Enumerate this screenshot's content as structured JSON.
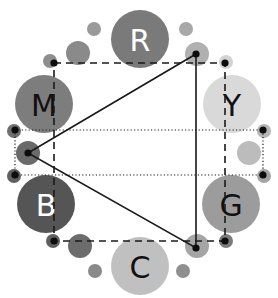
{
  "diagram": {
    "type": "color-wheel",
    "colors": {
      "background": "#ffffff",
      "line": "#1a1a1a"
    },
    "nodes": [
      {
        "id": "R",
        "label": "R",
        "cx": 140,
        "cy": 39,
        "r": 29,
        "fill": "#7a7a7a",
        "text_color": "#ffffff"
      },
      {
        "id": "M",
        "label": "M",
        "cx": 44,
        "cy": 104,
        "r": 29,
        "fill": "#7d7d7d",
        "text_color": "#111111"
      },
      {
        "id": "Y",
        "label": "Y",
        "cx": 232,
        "cy": 104,
        "r": 29,
        "fill": "#d9d9d9",
        "text_color": "#111111"
      },
      {
        "id": "B",
        "label": "B",
        "cx": 46,
        "cy": 204,
        "r": 29,
        "fill": "#555555",
        "text_color": "#ffffff"
      },
      {
        "id": "G",
        "label": "G",
        "cx": 231,
        "cy": 204,
        "r": 29,
        "fill": "#9c9c9c",
        "text_color": "#111111"
      },
      {
        "id": "C",
        "label": "C",
        "cx": 140,
        "cy": 266,
        "r": 29,
        "fill": "#c0c0c0",
        "text_color": "#111111"
      }
    ],
    "small_circles": [
      {
        "cx": 94,
        "cy": 29,
        "r": 7,
        "fill": "#9a9a9a"
      },
      {
        "cx": 78,
        "cy": 53,
        "r": 12,
        "fill": "#8a8a8a"
      },
      {
        "cx": 50,
        "cy": 61,
        "r": 7,
        "fill": "#8e8e8e"
      },
      {
        "cx": 186,
        "cy": 29,
        "r": 7,
        "fill": "#a8a8a8"
      },
      {
        "cx": 197,
        "cy": 54,
        "r": 12,
        "fill": "#b0b0b0"
      },
      {
        "cx": 226,
        "cy": 62,
        "r": 7,
        "fill": "#d3d3d3"
      },
      {
        "cx": 14,
        "cy": 131,
        "r": 7,
        "fill": "#707070"
      },
      {
        "cx": 28,
        "cy": 153,
        "r": 12,
        "fill": "#6a6a6a"
      },
      {
        "cx": 14,
        "cy": 176,
        "r": 7,
        "fill": "#606060"
      },
      {
        "cx": 264,
        "cy": 131,
        "r": 7,
        "fill": "#b5b5b5"
      },
      {
        "cx": 249,
        "cy": 153,
        "r": 12,
        "fill": "#bcbcbc"
      },
      {
        "cx": 264,
        "cy": 176,
        "r": 7,
        "fill": "#a5a5a5"
      },
      {
        "cx": 53,
        "cy": 241,
        "r": 7,
        "fill": "#5f5f5f"
      },
      {
        "cx": 80,
        "cy": 246,
        "r": 12,
        "fill": "#6c6c6c"
      },
      {
        "cx": 95,
        "cy": 271,
        "r": 7,
        "fill": "#8a8a8a"
      },
      {
        "cx": 197,
        "cy": 246,
        "r": 12,
        "fill": "#a5a5a5"
      },
      {
        "cx": 226,
        "cy": 241,
        "r": 7,
        "fill": "#7b7b7b"
      },
      {
        "cx": 183,
        "cy": 271,
        "r": 7,
        "fill": "#8f8f8f"
      }
    ],
    "dots": [
      {
        "cx": 54,
        "cy": 63
      },
      {
        "cx": 196,
        "cy": 54
      },
      {
        "cx": 225,
        "cy": 63
      },
      {
        "cx": 15,
        "cy": 130
      },
      {
        "cx": 28,
        "cy": 153
      },
      {
        "cx": 15,
        "cy": 175
      },
      {
        "cx": 263,
        "cy": 130
      },
      {
        "cx": 263,
        "cy": 175
      },
      {
        "cx": 54,
        "cy": 241
      },
      {
        "cx": 196,
        "cy": 248
      },
      {
        "cx": 225,
        "cy": 241
      }
    ],
    "dashed_rect": {
      "x1": 54,
      "y1": 63,
      "x2": 225,
      "y2": 241
    },
    "dotted_band": {
      "x1": 15,
      "y1": 130,
      "x2": 263,
      "y2": 175
    },
    "triangle": [
      [
        28,
        153
      ],
      [
        196,
        54
      ],
      [
        196,
        248
      ]
    ]
  }
}
